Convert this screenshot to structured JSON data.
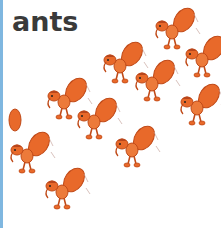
{
  "card": {
    "word": "ants",
    "illustration": "ant-swarm-illustration",
    "ant_count": 11,
    "colors": {
      "ant_body": "#e8692a",
      "ant_dark": "#c04a18",
      "text": "#3a3a3a",
      "border": "#7fb7e0"
    }
  }
}
